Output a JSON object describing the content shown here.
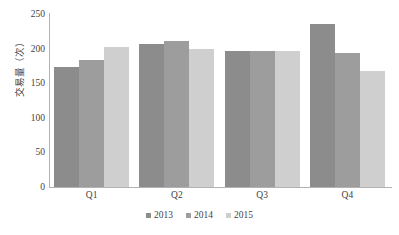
{
  "chart_data": {
    "type": "bar",
    "title": "",
    "xlabel": "",
    "ylabel": "交易量（次）",
    "categories": [
      "Q1",
      "Q2",
      "Q3",
      "Q4"
    ],
    "series": [
      {
        "name": "2013",
        "color": "#8c8c8c",
        "values": [
          174,
          207,
          197,
          236
        ]
      },
      {
        "name": "2014",
        "color": "#9d9d9d",
        "values": [
          184,
          211,
          197,
          194
        ]
      },
      {
        "name": "2015",
        "color": "#cfcfcf",
        "values": [
          203,
          199,
          197,
          167
        ]
      }
    ],
    "ylim": [
      0,
      250
    ],
    "yticks": [
      250,
      200,
      150,
      100,
      50,
      0
    ],
    "ytick_labels": [
      "250",
      "200",
      "150",
      "100",
      "50",
      "0"
    ],
    "grid": false,
    "legend_position": "bottom"
  }
}
